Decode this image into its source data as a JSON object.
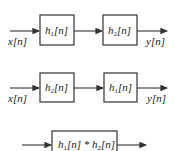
{
  "diagrams": [
    {
      "input": "x[n]",
      "output": "y[n]",
      "blocks": [
        {
          "name": "h",
          "sub": "1",
          "arg": "[n]"
        },
        {
          "name": "h",
          "sub": "2",
          "arg": "[n]"
        }
      ]
    },
    {
      "input": "x[n]",
      "output": "y[n]",
      "blocks": [
        {
          "name": "h",
          "sub": "2",
          "arg": "[n]"
        },
        {
          "name": "h",
          "sub": "1",
          "arg": "[n]"
        }
      ]
    },
    {
      "blocks": [
        {
          "name1": "h",
          "sub1": "1",
          "arg1": "[n]",
          "op": " * ",
          "name2": "h",
          "sub2": "2",
          "arg2": "[n]"
        }
      ]
    }
  ]
}
